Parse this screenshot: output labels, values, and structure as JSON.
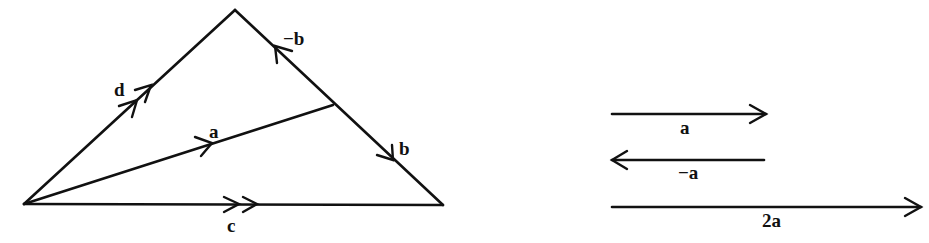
{
  "figure": {
    "type": "vector diagram",
    "colors": {
      "stroke": "#111111",
      "background": "#ffffff"
    }
  },
  "triangle": {
    "vertices": {
      "left": [
        24,
        204
      ],
      "apex": [
        235,
        10
      ],
      "right": [
        443,
        205
      ]
    },
    "junction_on_right_side": [
      333,
      105
    ],
    "vectors": [
      {
        "id": "d",
        "label": "d",
        "from": "left",
        "to": "apex",
        "arrowheads": 2
      },
      {
        "id": "a",
        "label": "a",
        "from": "left",
        "to": "junction",
        "arrowheads": 1
      },
      {
        "id": "c",
        "label": "c",
        "from": "left",
        "to": "right",
        "arrowheads": 2
      },
      {
        "id": "neg_b",
        "label": "−b",
        "direction": "toward apex along right side",
        "arrowheads": 1
      },
      {
        "id": "b",
        "label": "b",
        "direction": "toward right vertex along right side",
        "arrowheads": 1
      }
    ]
  },
  "scalar_multiples": [
    {
      "id": "a",
      "label": "a",
      "direction": "right",
      "length": 155
    },
    {
      "id": "neg_a",
      "label": "−a",
      "direction": "left",
      "length": 153
    },
    {
      "id": "two_a",
      "label": "2a",
      "direction": "right",
      "length": 310
    }
  ],
  "labels": {
    "d": "d",
    "a": "a",
    "c": "c",
    "neg_b": "−b",
    "b": "b",
    "right_a": "a",
    "right_neg_a": "−a",
    "right_2a": "2a"
  }
}
